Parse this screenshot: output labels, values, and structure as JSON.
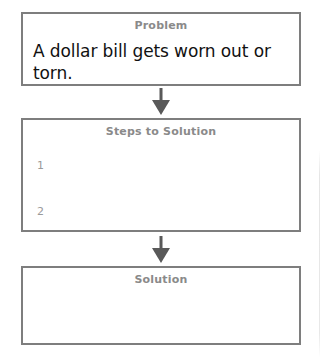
{
  "worksheet": {
    "colors": {
      "box_border": "#7e7e7e",
      "header_text": "#8a8a8a",
      "body_text": "#111111",
      "arrow": "#595959",
      "background": "#ffffff"
    },
    "boxes": [
      {
        "id": "problem",
        "header": "Problem",
        "body": "A dollar bill gets worn out or torn."
      },
      {
        "id": "steps-to-solution",
        "header": "Steps to Solution",
        "steps": [
          {
            "number": "1",
            "text": ""
          },
          {
            "number": "2",
            "text": ""
          }
        ]
      },
      {
        "id": "solution",
        "header": "Solution",
        "body": ""
      }
    ],
    "connectors": [
      {
        "id": "arrow-problem-to-steps",
        "direction": "down"
      },
      {
        "id": "arrow-steps-to-solution",
        "direction": "down"
      }
    ]
  }
}
